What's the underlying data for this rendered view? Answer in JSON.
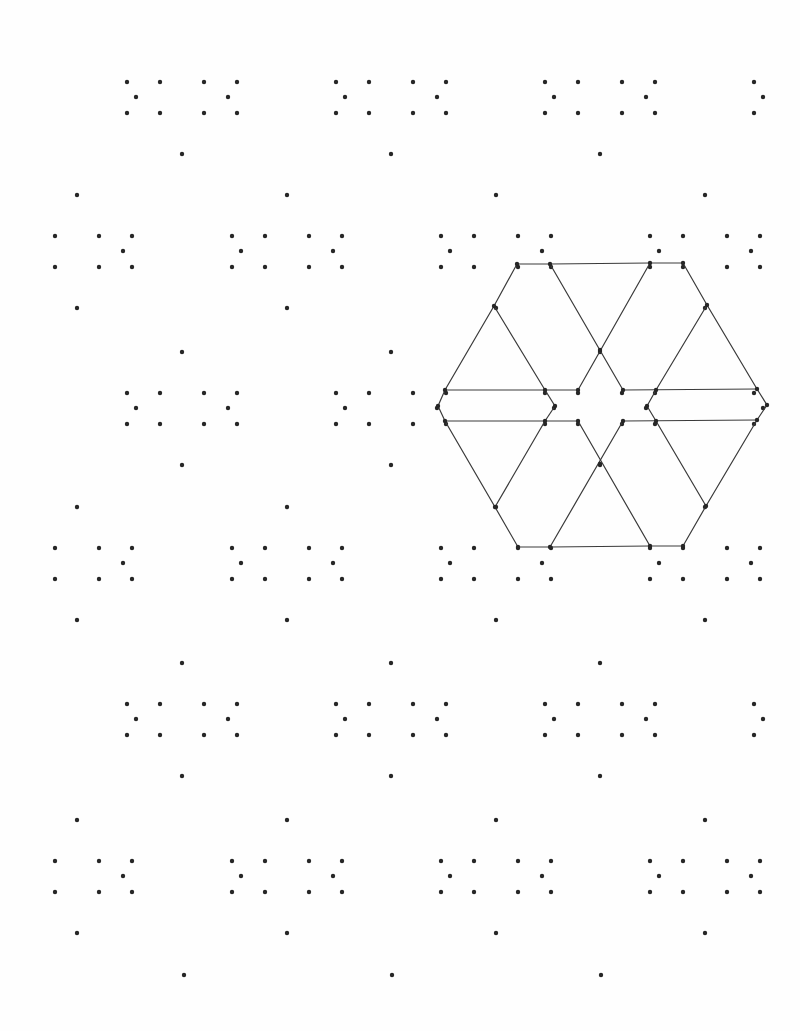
{
  "worksheet": {
    "type": "isometric dot-grid worksheet",
    "background_color": "#fefefe",
    "dot_color": "#262626",
    "line_color": "#3a3a3a",
    "dot_radius": 2.2,
    "clip": {
      "x_min": 45,
      "x_max": 772,
      "y_min": 70,
      "y_max": 990
    },
    "motif": {
      "description": "repeated 12-dot motif: 10-dot central cluster plus top and bottom dots",
      "offsets": [
        [
          -55,
          -15
        ],
        [
          -22,
          -15
        ],
        [
          -46,
          0
        ],
        [
          -55,
          16
        ],
        [
          -22,
          16
        ],
        [
          22,
          -15
        ],
        [
          55,
          -15
        ],
        [
          46,
          0
        ],
        [
          22,
          16
        ],
        [
          55,
          16
        ],
        [
          0,
          -56
        ],
        [
          0,
          57
        ]
      ]
    },
    "lattice": {
      "rows": [
        {
          "y": 97,
          "xs": [
            182,
            391,
            600,
            809
          ],
          "omit_top": true
        },
        {
          "y": 251,
          "xs": [
            77,
            287,
            496,
            705
          ]
        },
        {
          "y": 408,
          "xs": [
            182,
            391,
            600,
            809
          ]
        },
        {
          "y": 563,
          "xs": [
            77,
            287,
            496,
            705
          ]
        },
        {
          "y": 719,
          "xs": [
            182,
            391,
            600,
            809
          ]
        },
        {
          "y": 876,
          "xs": [
            77,
            287,
            496,
            705
          ]
        },
        {
          "y": 1031,
          "xs": [
            184,
            392,
            601
          ],
          "only_top": true
        }
      ]
    },
    "drawn_figure": {
      "name": "hexagon star pattern",
      "center": [
        600,
        405
      ],
      "outline": [
        [
          517,
          264
        ],
        [
          550,
          264
        ],
        [
          650,
          263
        ],
        [
          683,
          263
        ],
        [
          707,
          305
        ],
        [
          757,
          389
        ],
        [
          767,
          405
        ],
        [
          757,
          420
        ],
        [
          706,
          506
        ],
        [
          683,
          546
        ],
        [
          650,
          546
        ],
        [
          550,
          547
        ],
        [
          518,
          547
        ],
        [
          495,
          507
        ],
        [
          445,
          421
        ],
        [
          438,
          406
        ],
        [
          445,
          390
        ],
        [
          494,
          306
        ]
      ],
      "segments": [
        [
          [
            550,
            264
          ],
          [
            623,
            390
          ]
        ],
        [
          [
            650,
            263
          ],
          [
            578,
            390
          ]
        ],
        [
          [
            494,
            306
          ],
          [
            545,
            390
          ]
        ],
        [
          [
            707,
            305
          ],
          [
            656,
            390
          ]
        ],
        [
          [
            445,
            390
          ],
          [
            578,
            390
          ]
        ],
        [
          [
            623,
            390
          ],
          [
            757,
            389
          ]
        ],
        [
          [
            545,
            390
          ],
          [
            555,
            406
          ]
        ],
        [
          [
            555,
            406
          ],
          [
            545,
            421
          ]
        ],
        [
          [
            656,
            390
          ],
          [
            647,
            406
          ]
        ],
        [
          [
            647,
            406
          ],
          [
            656,
            421
          ]
        ],
        [
          [
            445,
            421
          ],
          [
            578,
            421
          ]
        ],
        [
          [
            623,
            421
          ],
          [
            757,
            420
          ]
        ],
        [
          [
            545,
            421
          ],
          [
            495,
            507
          ]
        ],
        [
          [
            578,
            421
          ],
          [
            650,
            546
          ]
        ],
        [
          [
            623,
            421
          ],
          [
            550,
            547
          ]
        ],
        [
          [
            656,
            421
          ],
          [
            706,
            506
          ]
        ]
      ]
    }
  }
}
